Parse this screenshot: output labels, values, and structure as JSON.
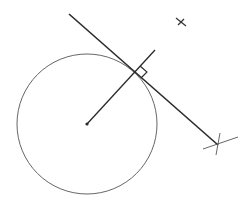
{
  "diagram": {
    "title": "",
    "type": "geometry-tangent-to-circle",
    "colors": {
      "background": "#ffffff",
      "ink": "#2a2a2a",
      "circle": "#555555"
    },
    "circle": {
      "cx": 87,
      "cy": 124,
      "r": 70
    },
    "center_point": {
      "x": 87,
      "y": 124
    },
    "radius_line": {
      "x1": 87,
      "y1": 124,
      "x2": 155,
      "y2": 50
    },
    "tangent_line": {
      "x1": 69,
      "y1": 14,
      "x2": 218,
      "y2": 145
    },
    "tangent_point": {
      "x": 135,
      "y": 72
    },
    "right_angle_marker": {
      "points": "135,72 142,65 149,71 142,78"
    },
    "construction_marks": [
      {
        "name": "upper-cross",
        "x": 181,
        "y": 22
      },
      {
        "name": "end-cross",
        "x": 218,
        "y": 145
      }
    ]
  }
}
